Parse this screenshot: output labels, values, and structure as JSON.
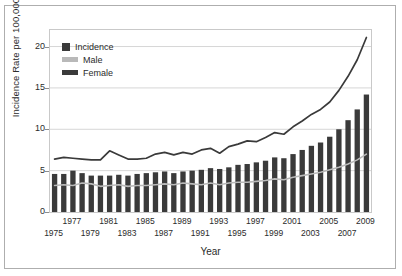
{
  "chart_data": {
    "type": "bar",
    "title": "",
    "xlabel": "Year",
    "ylabel": "Incidence Rate per 100,000",
    "ylim": [
      0,
      22
    ],
    "yticks": [
      0,
      5,
      10,
      15,
      20
    ],
    "ytick_labels": [
      "0",
      "5",
      "10",
      "15",
      "20"
    ],
    "grid": true,
    "grid_axis": "y",
    "legend_position": "upper-left",
    "categories": [
      1975,
      1976,
      1977,
      1978,
      1979,
      1980,
      1981,
      1982,
      1983,
      1984,
      1985,
      1986,
      1987,
      1988,
      1989,
      1990,
      1991,
      1992,
      1993,
      1994,
      1995,
      1996,
      1997,
      1998,
      1999,
      2000,
      2001,
      2002,
      2003,
      2004,
      2005,
      2006,
      2007,
      2008,
      2009
    ],
    "xtick_labels_top": [
      "1977",
      "1981",
      "1985",
      "1989",
      "1993",
      "1997",
      "2001",
      "2005",
      "2009"
    ],
    "xtick_labels_bottom": [
      "1975",
      "1979",
      "1983",
      "1987",
      "1991",
      "1995",
      "1999",
      "2003",
      "2007"
    ],
    "series": [
      {
        "name": "Incidence",
        "type": "line",
        "color": "#3a3a3a",
        "values": [
          6.4,
          6.6,
          6.5,
          6.4,
          6.3,
          6.3,
          7.4,
          6.9,
          6.4,
          6.4,
          6.5,
          7.0,
          7.2,
          6.9,
          7.2,
          7.0,
          7.5,
          7.7,
          7.1,
          7.9,
          8.2,
          8.6,
          8.5,
          9.0,
          9.6,
          9.4,
          10.3,
          11.0,
          11.8,
          12.4,
          13.3,
          14.7,
          16.4,
          18.4,
          21.1
        ]
      },
      {
        "name": "Male",
        "type": "line",
        "color": "#b9b9b9",
        "values": [
          3.2,
          3.3,
          3.2,
          3.5,
          3.4,
          3.1,
          3.2,
          3.3,
          3.1,
          3.2,
          3.2,
          3.3,
          3.4,
          3.3,
          3.5,
          3.4,
          3.3,
          3.5,
          3.3,
          3.5,
          3.6,
          3.6,
          3.7,
          3.8,
          4.0,
          3.9,
          4.2,
          4.4,
          4.6,
          4.8,
          5.1,
          5.4,
          5.8,
          6.3,
          7.0
        ]
      },
      {
        "name": "Female",
        "type": "bar",
        "color": "#3a3a3a",
        "values": [
          4.6,
          4.6,
          5.0,
          4.7,
          4.4,
          4.4,
          4.4,
          4.5,
          4.4,
          4.6,
          4.7,
          4.8,
          4.9,
          4.7,
          4.9,
          5.0,
          5.1,
          5.3,
          5.2,
          5.4,
          5.7,
          5.8,
          6.0,
          6.2,
          6.6,
          6.5,
          7.0,
          7.5,
          8.0,
          8.4,
          9.1,
          10.0,
          11.1,
          12.4,
          14.2
        ]
      }
    ]
  },
  "legend": {
    "items": [
      {
        "label": "Incidence",
        "swatch": "square-dark"
      },
      {
        "label": "Male",
        "swatch": "bar-light-gray"
      },
      {
        "label": "Female",
        "swatch": "bar-dark"
      }
    ]
  },
  "axes": {
    "y_title": "Incidence Rate per 100,000",
    "x_title": "Year"
  }
}
